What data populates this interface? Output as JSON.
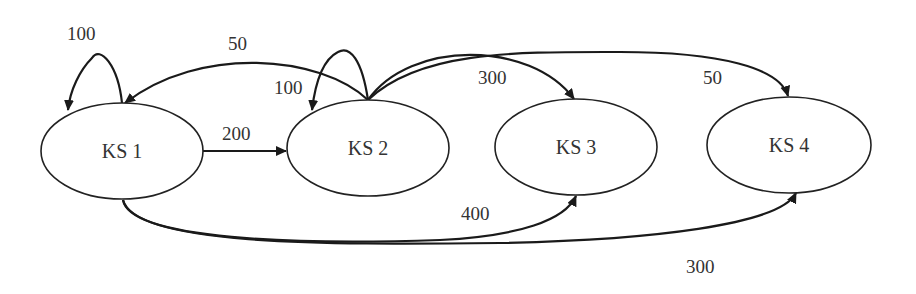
{
  "diagram": {
    "type": "state-transition-graph",
    "nodes": [
      {
        "id": "ks1",
        "label": "KS 1"
      },
      {
        "id": "ks2",
        "label": "KS 2"
      },
      {
        "id": "ks3",
        "label": "KS 3"
      },
      {
        "id": "ks4",
        "label": "KS 4"
      }
    ],
    "edges": [
      {
        "from": "KS 1",
        "to": "KS 1",
        "label": "100"
      },
      {
        "from": "KS 1",
        "to": "KS 2",
        "label": "200"
      },
      {
        "from": "KS 2",
        "to": "KS 1",
        "label": "50"
      },
      {
        "from": "KS 2",
        "to": "KS 2",
        "label": "100"
      },
      {
        "from": "KS 2",
        "to": "KS 3",
        "label": "300"
      },
      {
        "from": "KS 2",
        "to": "KS 4",
        "label": "50"
      },
      {
        "from": "KS 1",
        "to": "KS 3",
        "label": "400"
      },
      {
        "from": "KS 1",
        "to": "KS 4",
        "label": "300"
      }
    ]
  }
}
